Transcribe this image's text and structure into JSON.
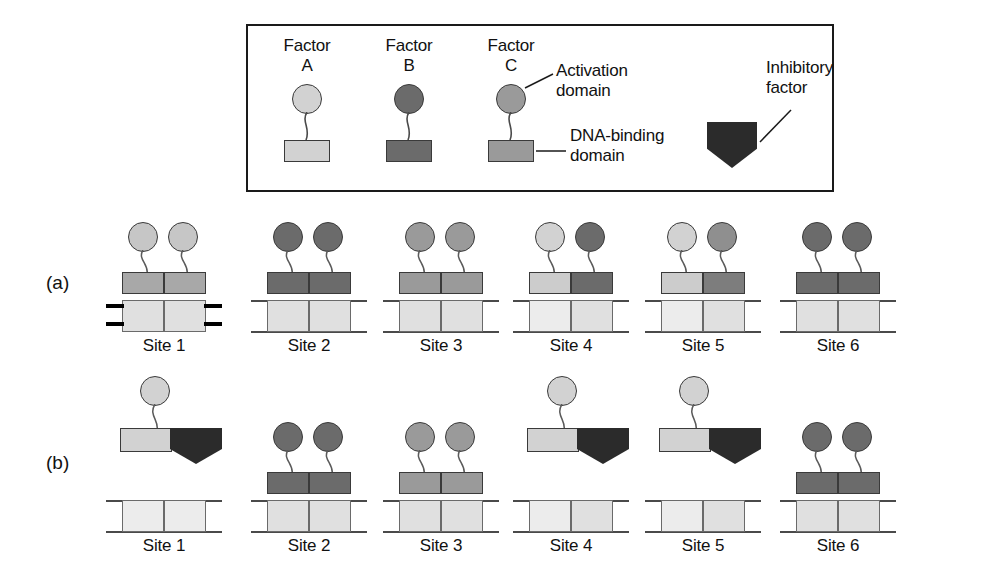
{
  "figure": {
    "panels": [
      {
        "id": "a",
        "label": "(a)"
      },
      {
        "id": "b",
        "label": "(b)"
      }
    ]
  },
  "legend": {
    "items": [
      {
        "name": "Factor A",
        "title": "Factor\nA",
        "circle_color": "#d2d2d2",
        "box_color": "#d2d2d2"
      },
      {
        "name": "Factor B",
        "title": "Factor\nB",
        "circle_color": "#6b6b6b",
        "box_color": "#6b6b6b"
      },
      {
        "name": "Factor C",
        "title": "Factor\nC",
        "circle_color": "#9a9a9a",
        "box_color": "#9a9a9a"
      }
    ],
    "callouts": [
      {
        "name": "activation-domain",
        "text": "Activation\ndomain"
      },
      {
        "name": "dna-binding-domain",
        "text": "DNA-binding\ndomain"
      },
      {
        "name": "inhibitory-factor",
        "text": "Inhibitory\nfactor"
      }
    ],
    "inhibitory_color": "#2b2b2b"
  },
  "colors": {
    "light": "#d2d2d2",
    "medium": "#9a9a9a",
    "dark": "#6b6b6b",
    "inhibitory": "#2b2b2b",
    "dna": "#e0e0e0",
    "outline": "#3a3a3a"
  },
  "panel_a": {
    "label": "(a)",
    "sites": [
      {
        "label": "Site 1",
        "left_factor": "A",
        "right_factor": "A",
        "left_circle": "#c6c6c6",
        "right_circle": "#c6c6c6",
        "left_box": "#a8a8a8",
        "right_box": "#a8a8a8",
        "bound": true,
        "active": true,
        "inhibited": false
      },
      {
        "label": "Site 2",
        "left_factor": "B",
        "right_factor": "B",
        "left_circle": "#6b6b6b",
        "right_circle": "#6b6b6b",
        "left_box": "#6b6b6b",
        "right_box": "#6b6b6b",
        "bound": true,
        "active": false,
        "inhibited": false
      },
      {
        "label": "Site 3",
        "left_factor": "C",
        "right_factor": "C",
        "left_circle": "#8f8f8f",
        "right_circle": "#8f8f8f",
        "left_box": "#8f8f8f",
        "right_box": "#8f8f8f",
        "bound": true,
        "active": false,
        "inhibited": false
      },
      {
        "label": "Site 4",
        "left_factor": "A",
        "right_factor": "B",
        "left_circle": "#d2d2d2",
        "right_circle": "#6b6b6b",
        "left_box": "#cccccc",
        "right_box": "#6b6b6b",
        "bound": true,
        "active": false,
        "inhibited": false
      },
      {
        "label": "Site 5",
        "left_factor": "A",
        "right_factor": "C",
        "left_circle": "#d2d2d2",
        "right_circle": "#8f8f8f",
        "left_box": "#cccccc",
        "right_box": "#7d7d7d",
        "bound": true,
        "active": false,
        "inhibited": false
      },
      {
        "label": "Site 6",
        "left_factor": "B",
        "right_factor": "B",
        "left_circle": "#6b6b6b",
        "right_circle": "#6b6b6b",
        "left_box": "#6b6b6b",
        "right_box": "#6b6b6b",
        "bound": true,
        "active": false,
        "inhibited": false
      }
    ]
  },
  "panel_b": {
    "label": "(b)",
    "sites": [
      {
        "label": "Site 1",
        "left_factor": "A",
        "right_factor": "inhibitory",
        "left_circle": "#d2d2d2",
        "left_box": "#d2d2d2",
        "right_box": "#2b2b2b",
        "bound": false,
        "inhibited": true
      },
      {
        "label": "Site 2",
        "left_factor": "B",
        "right_factor": "B",
        "left_circle": "#6b6b6b",
        "right_circle": "#6b6b6b",
        "left_box": "#6b6b6b",
        "right_box": "#6b6b6b",
        "bound": true,
        "inhibited": false
      },
      {
        "label": "Site 3",
        "left_factor": "C",
        "right_factor": "C",
        "left_circle": "#8f8f8f",
        "right_circle": "#8f8f8f",
        "left_box": "#8f8f8f",
        "right_box": "#8f8f8f",
        "bound": true,
        "inhibited": false
      },
      {
        "label": "Site 4",
        "left_factor": "A",
        "right_factor": "inhibitory",
        "left_circle": "#d2d2d2",
        "left_box": "#d2d2d2",
        "right_box": "#2b2b2b",
        "bound": false,
        "inhibited": true
      },
      {
        "label": "Site 5",
        "left_factor": "A",
        "right_factor": "inhibitory",
        "left_circle": "#d2d2d2",
        "left_box": "#d2d2d2",
        "right_box": "#2b2b2b",
        "bound": false,
        "inhibited": true
      },
      {
        "label": "Site 6",
        "left_factor": "B",
        "right_factor": "B",
        "left_circle": "#6b6b6b",
        "right_circle": "#6b6b6b",
        "left_box": "#6b6b6b",
        "right_box": "#6b6b6b",
        "bound": true,
        "inhibited": false
      }
    ]
  }
}
